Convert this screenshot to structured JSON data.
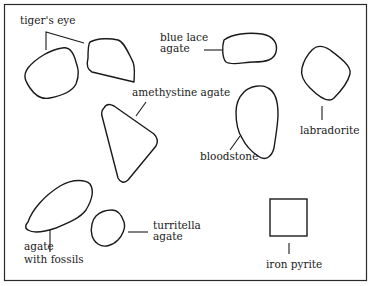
{
  "diagram": {
    "type": "labeled stone outlines",
    "border_color": "#1a1a1a",
    "labels": {
      "tigers_eye": "tiger's eye",
      "blue_lace_agate_1": "blue lace",
      "blue_lace_agate_2": "agate",
      "amethystine_agate": "amethystine agate",
      "labradorite": "labradorite",
      "bloodstone": "bloodstone",
      "agate_with_fossils_1": "agate",
      "agate_with_fossils_2": "with fossils",
      "turritella_agate_1": "turritella",
      "turritella_agate_2": "agate",
      "iron_pyrite": "iron pyrite"
    }
  }
}
